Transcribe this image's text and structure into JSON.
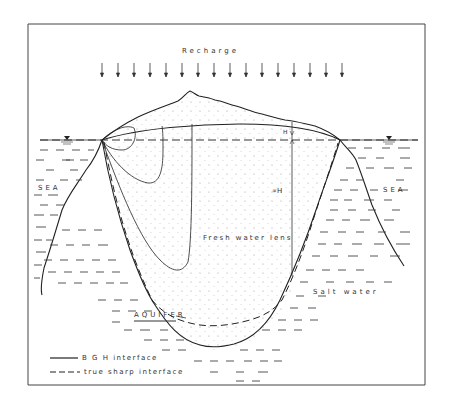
{
  "figure": {
    "title": "Recharge",
    "labels": {
      "sea_left": "SEA",
      "sea_right": "SEA",
      "alpha_h": "∝H",
      "h": "H",
      "fresh_water_lens": "Fresh water lens",
      "salt_water": "Salt water",
      "aquifer": "AQUIFER"
    },
    "legend": [
      {
        "style": "solid",
        "label": "B G H interface"
      },
      {
        "style": "dashed",
        "label": "true sharp interface"
      }
    ],
    "colors": {
      "line": "#222222",
      "background": "#ffffff",
      "stipple": "#9a9a9a"
    }
  }
}
